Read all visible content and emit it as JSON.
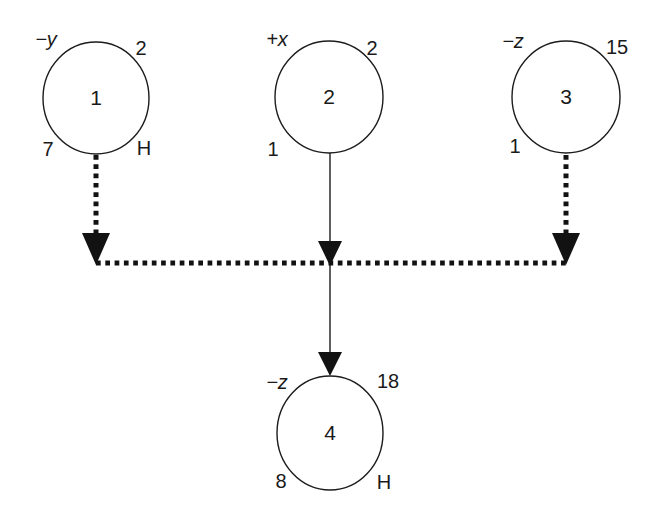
{
  "figure": {
    "nodes": [
      {
        "id": "1",
        "center_label": "1",
        "top_left": "−y",
        "top_right": "2",
        "bottom_left": "7",
        "bottom_right": "H"
      },
      {
        "id": "2",
        "center_label": "2",
        "top_left": "+x",
        "top_right": "2",
        "bottom_left": "1",
        "bottom_right": ""
      },
      {
        "id": "3",
        "center_label": "3",
        "top_left": "−z",
        "top_right": "15",
        "bottom_left": "1",
        "bottom_right": ""
      },
      {
        "id": "4",
        "center_label": "4",
        "top_left": "−z",
        "top_right": "18",
        "bottom_left": "8",
        "bottom_right": "H"
      }
    ],
    "edges": [
      {
        "from": "1",
        "to": "junction-bar",
        "style": "dotted",
        "arrow": "down"
      },
      {
        "from": "2",
        "to": "junction-bar",
        "style": "solid",
        "arrow": "down"
      },
      {
        "from": "3",
        "to": "junction-bar",
        "style": "dotted",
        "arrow": "down"
      },
      {
        "from": "junction-bar",
        "to": "4",
        "style": "solid",
        "arrow": "down"
      }
    ],
    "colors": {
      "ink": "#1c1c1c",
      "background": "#ffffff"
    }
  }
}
